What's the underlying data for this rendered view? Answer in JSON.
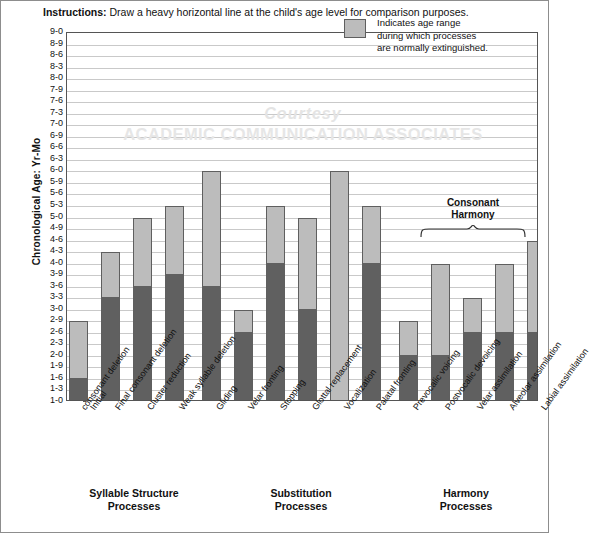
{
  "instructions": {
    "lead": "Instructions:",
    "text": " Draw a heavy horizontal line at the child's age level for comparison purposes."
  },
  "legend": {
    "swatch_color": "#bcbcbc",
    "line1": "Indicates age range",
    "line2": "during which processes",
    "line3": "are normally extinguished."
  },
  "watermark": {
    "line1": "Courtesy",
    "line2": "ACADEMIC COMMUNICATION ASSOCIATES"
  },
  "annotation": {
    "consonant_harmony_line1": "Consonant",
    "consonant_harmony_line2": "Harmony"
  },
  "groups": [
    {
      "name": "Syllable Structure Processes",
      "line1": "Syllable Structure",
      "line2": "Processes"
    },
    {
      "name": "Substitution Processes",
      "line1": "Substitution",
      "line2": "Processes"
    },
    {
      "name": "Harmony Processes",
      "line1": "Harmony",
      "line2": "Processes"
    }
  ],
  "chart_data": {
    "type": "bar",
    "title": "",
    "xlabel": "",
    "ylabel": "Chronological Age: Yr-Mo",
    "ylim": [
      1.0,
      9.0
    ],
    "grid": true,
    "legend_position": "top-right",
    "ytick_labels": [
      "9-0",
      "8-9",
      "8-6",
      "8-3",
      "8-0",
      "7-9",
      "7-6",
      "7-3",
      "7-0",
      "6-9",
      "6-6",
      "6-3",
      "6-0",
      "5-9",
      "5-6",
      "5-3",
      "5-0",
      "4-9",
      "4-6",
      "4-3",
      "4-0",
      "3-9",
      "3-6",
      "3-3",
      "3-0",
      "2-9",
      "2-6",
      "2-3",
      "2-0",
      "1-9",
      "1-6",
      "1-3",
      "1-0"
    ],
    "ytick_values": [
      9.0,
      8.75,
      8.5,
      8.25,
      8.0,
      7.75,
      7.5,
      7.25,
      7.0,
      6.75,
      6.5,
      6.25,
      6.0,
      5.75,
      5.5,
      5.25,
      5.0,
      4.75,
      4.5,
      4.25,
      4.0,
      3.75,
      3.5,
      3.25,
      3.0,
      2.75,
      2.5,
      2.25,
      2.0,
      1.75,
      1.5,
      1.25,
      1.0
    ],
    "series": [
      {
        "name": "Suppression in progress (dark)",
        "color": "#606060"
      },
      {
        "name": "Indicates age range during which processes are normally extinguished (light)",
        "color": "#bcbcbc"
      }
    ],
    "categories": [
      "Initial consonant deletion",
      "Final consonant deletion",
      "Cluster reduction",
      "Weak syllable deletion",
      "Gliding",
      "Velar fronting",
      "Stopping",
      "Glottal replacement",
      "Vocalization",
      "Palatal fronting",
      "Prevocalic voicing",
      "Postvocalic devoicing",
      "Velar assimilation",
      "Alveolar assimilation",
      "Labial assimilation"
    ],
    "bars": [
      {
        "label": "Initial consonant deletion",
        "label_line1": "Initial",
        "label_line2": "consonant deletion",
        "group": 0,
        "dark_top": 1.5,
        "dark_top_label": "1-6",
        "light_top": 2.75,
        "light_top_label": "2-9"
      },
      {
        "label": "Final consonant deletion",
        "label_line1": "Final consonant deletion",
        "label_line2": "",
        "group": 0,
        "dark_top": 3.25,
        "dark_top_label": "3-3",
        "light_top": 4.25,
        "light_top_label": "4-3"
      },
      {
        "label": "Cluster reduction",
        "label_line1": "Cluster reduction",
        "label_line2": "",
        "group": 0,
        "dark_top": 3.5,
        "dark_top_label": "3-6",
        "light_top": 5.0,
        "light_top_label": "5-0"
      },
      {
        "label": "Weak syllable deletion",
        "label_line1": "Weak syllable deletion",
        "label_line2": "",
        "group": 0,
        "dark_top": 3.75,
        "dark_top_label": "3-9",
        "light_top": 5.25,
        "light_top_label": "5-3"
      },
      {
        "label": "Gliding",
        "label_line1": "Gliding",
        "label_line2": "",
        "group": 1,
        "dark_top": 3.5,
        "dark_top_label": "3-6",
        "light_top": 6.0,
        "light_top_label": "6-0"
      },
      {
        "label": "Velar fronting",
        "label_line1": "Velar fronting",
        "label_line2": "",
        "group": 1,
        "dark_top": 2.5,
        "dark_top_label": "2-6",
        "light_top": 3.0,
        "light_top_label": "3-0"
      },
      {
        "label": "Stopping",
        "label_line1": "Stopping",
        "label_line2": "",
        "group": 1,
        "dark_top": 4.0,
        "dark_top_label": "4-0",
        "light_top": 5.25,
        "light_top_label": "5-3"
      },
      {
        "label": "Glottal replacement",
        "label_line1": "Glottal replacement",
        "label_line2": "",
        "group": 1,
        "dark_top": 3.0,
        "dark_top_label": "3-0",
        "light_top": 5.0,
        "light_top_label": "5-0"
      },
      {
        "label": "Vocalization",
        "label_line1": "Vocalization",
        "label_line2": "",
        "group": 1,
        "dark_top": 3.0,
        "dark_top_label": "3-0",
        "light_top": 6.0,
        "light_top_label": "6-0",
        "all_light": true
      },
      {
        "label": "Palatal fronting",
        "label_line1": "Palatal fronting",
        "label_line2": "",
        "group": 1,
        "dark_top": 4.0,
        "dark_top_label": "4-0",
        "light_top": 5.25,
        "light_top_label": "5-3"
      },
      {
        "label": "Prevocalic voicing",
        "label_line1": "Prevocalic voicing",
        "label_line2": "",
        "group": 2,
        "dark_top": 2.0,
        "dark_top_label": "2-0",
        "light_top": 2.75,
        "light_top_label": "2-9"
      },
      {
        "label": "Postvocalic devoicing",
        "label_line1": "Postvocalic devoicing",
        "label_line2": "",
        "group": 2,
        "dark_top": 2.0,
        "dark_top_label": "2-0",
        "light_top": 4.0,
        "light_top_label": "4-0"
      },
      {
        "label": "Velar assimilation",
        "label_line1": "Velar assimilation",
        "label_line2": "",
        "group": 2,
        "dark_top": 2.5,
        "dark_top_label": "2-6",
        "light_top": 3.25,
        "light_top_label": "3-3"
      },
      {
        "label": "Alveolar assimilation",
        "label_line1": "Alveolar assimilation",
        "label_line2": "",
        "group": 2,
        "dark_top": 2.5,
        "dark_top_label": "2-6",
        "light_top": 4.0,
        "light_top_label": "4-0"
      },
      {
        "label": "Labial assimilation",
        "label_line1": "Labial assimilation",
        "label_line2": "",
        "group": 2,
        "dark_top": 2.5,
        "dark_top_label": "2-6",
        "light_top": 4.5,
        "light_top_label": "4-6"
      }
    ]
  }
}
